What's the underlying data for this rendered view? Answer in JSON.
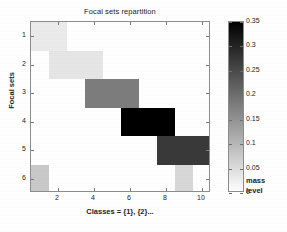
{
  "figure": {
    "title": "Focal sets repartition",
    "background_color": "#ffffff"
  },
  "axes": {
    "xlabel": "Classes = {1}, {2}...",
    "ylabel": "Focal sets",
    "xticks": [
      "2",
      "4",
      "6",
      "8",
      "10"
    ],
    "yticks": [
      "1",
      "2",
      "3",
      "4",
      "5",
      "6"
    ],
    "xlim": [
      0.5,
      10.5
    ],
    "ylim": [
      0.5,
      6.5
    ]
  },
  "colorbar": {
    "title_line1": "mass",
    "title_line2": "level",
    "ticks": [
      "0.35",
      "0.3",
      "0.25",
      "0.2",
      "0.15",
      "0.1",
      "0.05",
      "0"
    ],
    "tick_values": [
      0.35,
      0.3,
      0.25,
      0.2,
      0.15,
      0.1,
      0.05,
      0
    ],
    "min": 0,
    "max": 0.35,
    "colormap_low": "#ffffff",
    "colormap_high": "#000000"
  },
  "chart_data": {
    "type": "heatmap",
    "title": "Focal sets repartition",
    "xlabel": "Classes = {1}, {2}...",
    "ylabel": "Focal sets",
    "xlim": [
      0.5,
      10.5
    ],
    "ylim": [
      0.5,
      6.5
    ],
    "x_categories": [
      1,
      2,
      3,
      4,
      5,
      6,
      7,
      8,
      9,
      10
    ],
    "y_categories": [
      1,
      2,
      3,
      4,
      5,
      6
    ],
    "colorbar_label": "mass level",
    "zlim": [
      0,
      0.35
    ],
    "grid": false,
    "legend": "colorbar-right",
    "values": [
      [
        0.03,
        0.03,
        0.0,
        0.0,
        0.0,
        0.0,
        0.0,
        0.0,
        0.0,
        0.0
      ],
      [
        0.0,
        0.04,
        0.04,
        0.04,
        0.0,
        0.0,
        0.0,
        0.0,
        0.0,
        0.0
      ],
      [
        0.0,
        0.0,
        0.0,
        0.16,
        0.16,
        0.16,
        0.0,
        0.0,
        0.0,
        0.0
      ],
      [
        0.0,
        0.0,
        0.0,
        0.0,
        0.0,
        0.35,
        0.35,
        0.35,
        0.0,
        0.0
      ],
      [
        0.0,
        0.0,
        0.0,
        0.0,
        0.0,
        0.0,
        0.0,
        0.28,
        0.28,
        0.28
      ],
      [
        0.07,
        0.0,
        0.0,
        0.0,
        0.0,
        0.0,
        0.0,
        0.0,
        0.05,
        0.0
      ]
    ],
    "blocks": [
      {
        "row": 1,
        "x_start": 0.5,
        "x_end": 2.5,
        "value": 0.03,
        "color": "#ebebeb"
      },
      {
        "row": 2,
        "x_start": 1.5,
        "x_end": 4.5,
        "value": 0.04,
        "color": "#e6e6e6"
      },
      {
        "row": 3,
        "x_start": 3.5,
        "x_end": 6.5,
        "value": 0.16,
        "color": "#7d7d7d"
      },
      {
        "row": 4,
        "x_start": 5.5,
        "x_end": 8.5,
        "value": 0.35,
        "color": "#000000"
      },
      {
        "row": 5,
        "x_start": 7.5,
        "x_end": 10.5,
        "value": 0.28,
        "color": "#3a3a3a"
      },
      {
        "row": 6,
        "x_start": 0.5,
        "x_end": 1.5,
        "value": 0.07,
        "color": "#c9c9c9"
      },
      {
        "row": 6,
        "x_start": 8.5,
        "x_end": 9.5,
        "value": 0.05,
        "color": "#d8d8d8"
      }
    ]
  }
}
